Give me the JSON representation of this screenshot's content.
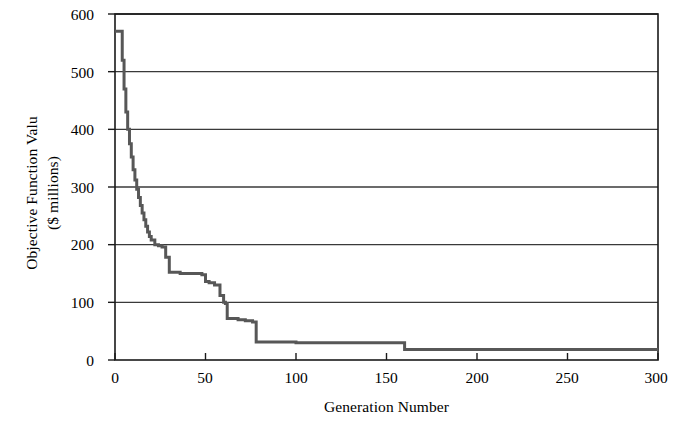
{
  "chart_data": {
    "type": "line",
    "title": "",
    "xlabel": "Generation Number",
    "ylabel_line1": "Objective Function Valu",
    "ylabel_line2": "($ millions)",
    "xlim": [
      0,
      300
    ],
    "ylim": [
      0,
      600
    ],
    "xticks": [
      0,
      50,
      100,
      150,
      200,
      250,
      300
    ],
    "yticks": [
      0,
      100,
      200,
      300,
      400,
      500,
      600
    ],
    "xtick_labels": [
      "0",
      "50",
      "100",
      "150",
      "200",
      "250",
      "300"
    ],
    "ytick_labels": [
      "0",
      "100",
      "200",
      "300",
      "400",
      "500",
      "600"
    ],
    "grid": "horizontal",
    "legend": "none",
    "series": [
      {
        "name": "Objective Function Value",
        "color": "#575757",
        "line_width": 3,
        "step": true,
        "x": [
          0,
          3,
          4,
          5,
          6,
          7,
          8,
          9,
          10,
          11,
          12,
          13,
          14,
          15,
          16,
          17,
          18,
          19,
          20,
          22,
          24,
          26,
          28,
          30,
          36,
          44,
          48,
          50,
          52,
          55,
          58,
          60,
          61,
          62,
          68,
          72,
          76,
          78,
          100,
          130,
          155,
          158,
          160,
          200,
          250,
          300
        ],
        "y": [
          570,
          570,
          520,
          470,
          430,
          400,
          375,
          352,
          330,
          312,
          296,
          282,
          268,
          255,
          243,
          232,
          222,
          214,
          208,
          200,
          198,
          196,
          178,
          152,
          150,
          150,
          148,
          136,
          134,
          130,
          112,
          100,
          98,
          72,
          70,
          68,
          66,
          31,
          30,
          30,
          30,
          30,
          18,
          18,
          18,
          18
        ]
      }
    ]
  },
  "axes": {
    "frame_color": "#1a1a1a",
    "grid_color": "#3a3a3a",
    "background": "#ffffff"
  }
}
